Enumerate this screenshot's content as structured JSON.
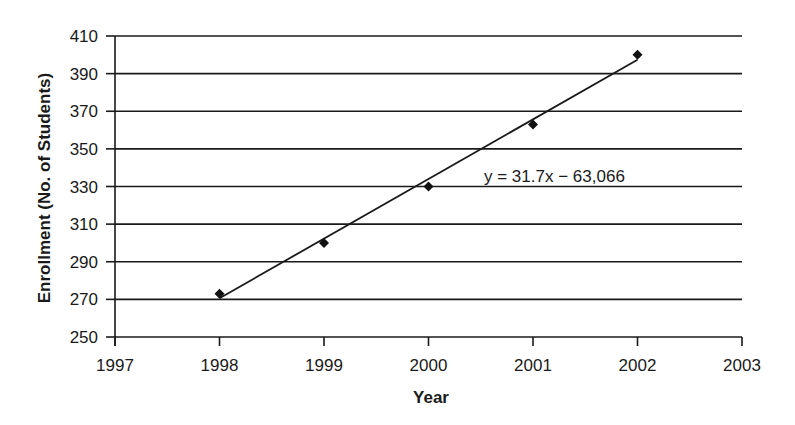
{
  "chart_data": {
    "type": "scatter",
    "title": "",
    "xlabel": "Year",
    "ylabel": "Enrollment (No. of Students)",
    "x": [
      1998,
      1999,
      2000,
      2001,
      2002
    ],
    "series": [
      {
        "name": "Enrollment",
        "marker": "diamond",
        "values": [
          273,
          300,
          330,
          363,
          400
        ]
      }
    ],
    "trendline": {
      "type": "linear",
      "equation": "y = 31.7x − 63,066",
      "slope": 31.7,
      "intercept": -63066,
      "x_start": 1998,
      "x_end": 2002
    },
    "xlim": [
      1997,
      2003
    ],
    "ylim": [
      250,
      410
    ],
    "x_ticks": [
      1997,
      1998,
      1999,
      2000,
      2001,
      2002,
      2003
    ],
    "y_ticks": [
      250,
      270,
      290,
      310,
      330,
      350,
      370,
      390,
      410
    ],
    "x_tick_labels": [
      "1997",
      "1998",
      "1999",
      "2000",
      "2001",
      "2002",
      "2003"
    ],
    "y_tick_labels": [
      "250",
      "270",
      "290",
      "310",
      "330",
      "350",
      "370",
      "390",
      "410"
    ],
    "grid": {
      "horizontal": true,
      "vertical": false
    },
    "legend": null,
    "annotation": {
      "text": "y = 31.7x − 63,066",
      "x_data": 2000.53,
      "y_data": 338
    }
  },
  "colors": {
    "ink": "#1a1a1a",
    "marker": "#111111",
    "background": "#ffffff"
  },
  "layout": {
    "plot_left": 115,
    "plot_right": 742,
    "plot_top": 36,
    "plot_bottom": 337
  }
}
